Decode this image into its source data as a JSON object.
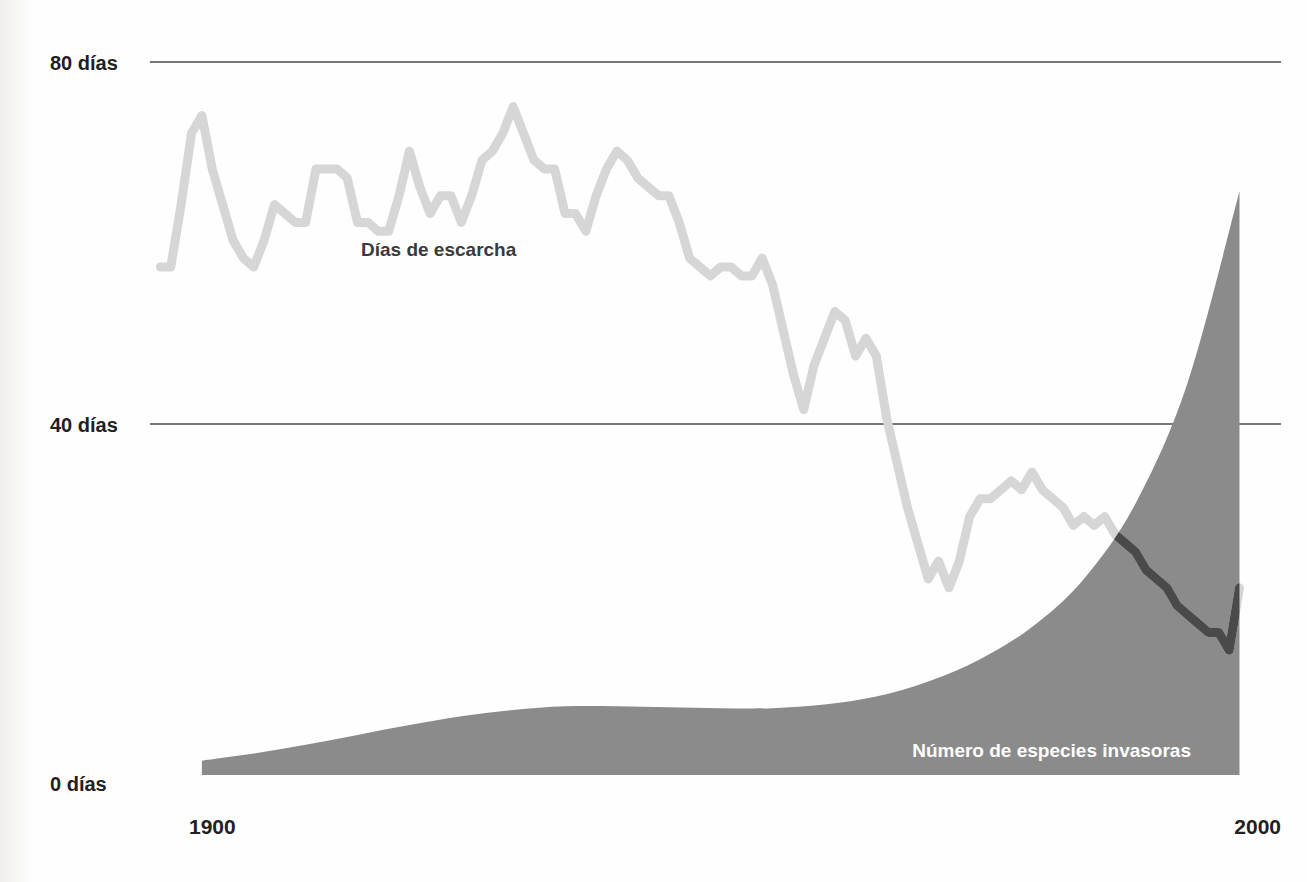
{
  "chart_data": {
    "type": "area",
    "title": "",
    "subtitle": "",
    "xlabel": "",
    "ylabel": "",
    "xlim": [
      1895,
      2004
    ],
    "ylim": [
      0,
      80
    ],
    "grid": true,
    "legend_position": "inline-annotations",
    "y_ticks": [
      {
        "value": 0,
        "label": "0 días",
        "gridline": false
      },
      {
        "value": 40,
        "label": "40 días",
        "gridline": true
      },
      {
        "value": 80,
        "label": "80 días",
        "gridline": true
      }
    ],
    "x_ticks": [
      {
        "value": 1900,
        "label": "1900"
      },
      {
        "value": 2000,
        "label": "2000"
      }
    ],
    "colors": {
      "frost_line": "#d6d6d6",
      "frost_line_over_fill": "#4a4a4a",
      "invasive_area_fill": "#8b8b8b",
      "gridline": "#4a4a4a",
      "text": "#231f20",
      "text_on_fill": "#ffffff",
      "background": "#fefefe"
    },
    "annotations": [
      {
        "name": "frost-series-label",
        "text": "Días de escarcha",
        "x": 1918,
        "y": 58,
        "color": "#3a3a3a"
      },
      {
        "name": "invasive-series-label",
        "text": "Número de especies invasoras",
        "x": 1976,
        "y": 5,
        "color": "#ffffff"
      }
    ],
    "series": [
      {
        "name": "Días de escarcha",
        "label": "Días de escarcha",
        "type": "line",
        "unit": "días",
        "color": "#d6d6d6",
        "x": [
          1896,
          1897,
          1898,
          1899,
          1900,
          1901,
          1902,
          1903,
          1904,
          1905,
          1906,
          1907,
          1908,
          1909,
          1910,
          1911,
          1912,
          1913,
          1914,
          1915,
          1916,
          1917,
          1918,
          1919,
          1920,
          1921,
          1922,
          1923,
          1924,
          1925,
          1926,
          1927,
          1928,
          1929,
          1930,
          1931,
          1932,
          1933,
          1934,
          1935,
          1936,
          1937,
          1938,
          1939,
          1940,
          1941,
          1942,
          1943,
          1944,
          1945,
          1946,
          1947,
          1948,
          1949,
          1950,
          1951,
          1952,
          1953,
          1954,
          1955,
          1956,
          1957,
          1958,
          1959,
          1960,
          1961,
          1962,
          1963,
          1964,
          1965,
          1966,
          1967,
          1968,
          1969,
          1970,
          1971,
          1972,
          1973,
          1974,
          1975,
          1976,
          1977,
          1978,
          1979,
          1980,
          1981,
          1982,
          1983,
          1984,
          1985,
          1986,
          1987,
          1988,
          1989,
          1990,
          1991,
          1992,
          1993,
          1994,
          1995,
          1996,
          1997,
          1998,
          1999,
          2000
        ],
        "values": [
          57,
          57,
          64,
          72,
          74,
          68,
          64,
          60,
          58,
          57,
          60,
          64,
          63,
          62,
          62,
          68,
          68,
          68,
          67,
          62,
          62,
          61,
          61,
          65,
          70,
          66,
          63,
          65,
          65,
          62,
          65,
          69,
          70,
          72,
          75,
          72,
          69,
          68,
          68,
          63,
          63,
          61,
          65,
          68,
          70,
          69,
          67,
          66,
          65,
          65,
          62,
          58,
          57,
          56,
          57,
          57,
          56,
          56,
          58,
          55,
          50,
          45,
          41,
          46,
          49,
          52,
          51,
          47,
          49,
          47,
          40,
          35,
          30,
          26,
          22,
          24,
          21,
          24,
          29,
          31,
          31,
          32,
          33,
          32,
          34,
          32,
          31,
          30,
          28,
          29,
          28,
          29,
          27,
          26,
          25,
          23,
          22,
          21,
          19,
          18,
          17,
          16,
          16,
          14,
          21
        ]
      },
      {
        "name": "Número de especies invasoras",
        "label": "Número de especies invasoras",
        "type": "area",
        "unit": "especies (escala relativa)",
        "color": "#8b8b8b",
        "x": [
          1900,
          1905,
          1910,
          1915,
          1920,
          1925,
          1930,
          1935,
          1940,
          1945,
          1950,
          1955,
          1960,
          1965,
          1970,
          1975,
          1980,
          1985,
          1990,
          1995,
          2000
        ],
        "values": [
          1.6,
          2.4,
          3.4,
          4.5,
          5.6,
          6.6,
          7.3,
          7.7,
          7.7,
          7.6,
          7.5,
          7.5,
          7.9,
          8.8,
          10.5,
          13.0,
          16.6,
          22.0,
          30.5,
          44.0,
          65.5
        ]
      }
    ]
  },
  "axis": {
    "y_label_80": "80 días",
    "y_label_40": "40 días",
    "y_label_0": "0 días",
    "x_label_left": "1900",
    "x_label_right": "2000"
  },
  "labels": {
    "frost": "Días de escarcha",
    "invasive": "Número de especies invasoras"
  }
}
